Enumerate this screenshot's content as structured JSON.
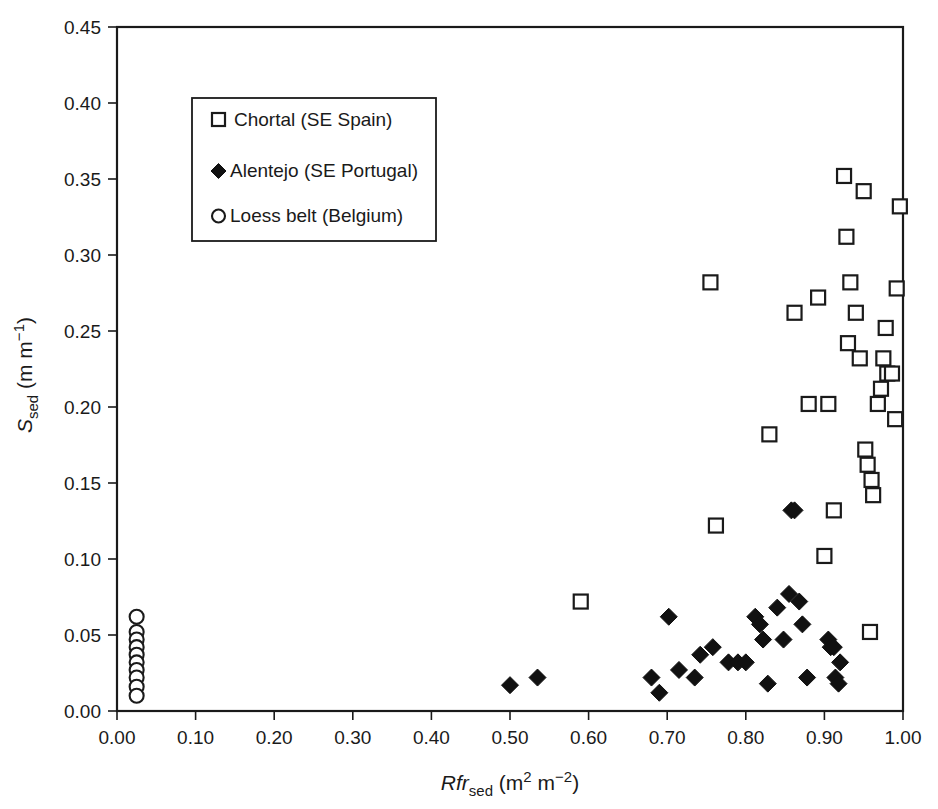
{
  "figure": {
    "width": 938,
    "height": 809,
    "background": "#ffffff",
    "ink_color": "#1a1a1a"
  },
  "chart_data": {
    "type": "scatter",
    "title": "",
    "subtitle": "",
    "xlabel_plain": "Rfr_sed (m2 m-2)",
    "ylabel_plain": "S_sed (m m-1)",
    "xlabel_parts": {
      "italic": "Rfr",
      "subscript": "sed",
      "units_prefix": " (m",
      "units_sup1": "2",
      "units_mid": " m",
      "units_sup2": "−2",
      "units_suffix": ")"
    },
    "ylabel_parts": {
      "italic": "S",
      "subscript": "sed",
      "units_prefix": " (m m",
      "units_sup": "−1",
      "units_suffix": ")"
    },
    "xlim": [
      0.0,
      1.0
    ],
    "ylim": [
      0.0,
      0.45
    ],
    "xticks": [
      0.0,
      0.1,
      0.2,
      0.3,
      0.4,
      0.5,
      0.6,
      0.7,
      0.8,
      0.9,
      1.0
    ],
    "xtick_labels": [
      "0.00",
      "0.10",
      "0.20",
      "0.30",
      "0.40",
      "0.50",
      "0.60",
      "0.70",
      "0.80",
      "0.90",
      "1.00"
    ],
    "yticks": [
      0.0,
      0.05,
      0.1,
      0.15,
      0.2,
      0.25,
      0.3,
      0.35,
      0.4,
      0.45
    ],
    "ytick_labels": [
      "0.00",
      "0.05",
      "0.10",
      "0.15",
      "0.20",
      "0.25",
      "0.30",
      "0.35",
      "0.40",
      "0.45"
    ],
    "grid": false,
    "legend_position": "upper-left-inside",
    "series": [
      {
        "name": "Chortal (SE Spain)",
        "marker": "open-square",
        "marker_color": "#ffffff",
        "edge_color": "#1a1a1a",
        "points": [
          [
            0.59,
            0.072
          ],
          [
            0.755,
            0.282
          ],
          [
            0.762,
            0.122
          ],
          [
            0.83,
            0.182
          ],
          [
            0.862,
            0.262
          ],
          [
            0.88,
            0.202
          ],
          [
            0.892,
            0.272
          ],
          [
            0.9,
            0.102
          ],
          [
            0.905,
            0.202
          ],
          [
            0.912,
            0.132
          ],
          [
            0.925,
            0.352
          ],
          [
            0.928,
            0.312
          ],
          [
            0.93,
            0.242
          ],
          [
            0.933,
            0.282
          ],
          [
            0.94,
            0.262
          ],
          [
            0.945,
            0.232
          ],
          [
            0.95,
            0.342
          ],
          [
            0.952,
            0.172
          ],
          [
            0.955,
            0.162
          ],
          [
            0.958,
            0.052
          ],
          [
            0.96,
            0.152
          ],
          [
            0.962,
            0.142
          ],
          [
            0.968,
            0.202
          ],
          [
            0.972,
            0.212
          ],
          [
            0.975,
            0.232
          ],
          [
            0.978,
            0.252
          ],
          [
            0.98,
            0.222
          ],
          [
            0.986,
            0.222
          ],
          [
            0.99,
            0.192
          ],
          [
            0.992,
            0.278
          ],
          [
            0.996,
            0.332
          ]
        ]
      },
      {
        "name": "Alentejo (SE Portugal)",
        "marker": "filled-diamond",
        "marker_color": "#111111",
        "edge_color": "#111111",
        "points": [
          [
            0.5,
            0.017
          ],
          [
            0.535,
            0.022
          ],
          [
            0.68,
            0.022
          ],
          [
            0.69,
            0.012
          ],
          [
            0.702,
            0.062
          ],
          [
            0.715,
            0.027
          ],
          [
            0.735,
            0.022
          ],
          [
            0.742,
            0.037
          ],
          [
            0.758,
            0.042
          ],
          [
            0.778,
            0.032
          ],
          [
            0.79,
            0.032
          ],
          [
            0.8,
            0.032
          ],
          [
            0.812,
            0.062
          ],
          [
            0.818,
            0.057
          ],
          [
            0.822,
            0.047
          ],
          [
            0.828,
            0.018
          ],
          [
            0.84,
            0.068
          ],
          [
            0.848,
            0.047
          ],
          [
            0.855,
            0.077
          ],
          [
            0.858,
            0.132
          ],
          [
            0.862,
            0.132
          ],
          [
            0.868,
            0.072
          ],
          [
            0.872,
            0.057
          ],
          [
            0.878,
            0.022
          ],
          [
            0.905,
            0.047
          ],
          [
            0.908,
            0.042
          ],
          [
            0.912,
            0.042
          ],
          [
            0.914,
            0.022
          ],
          [
            0.918,
            0.018
          ],
          [
            0.92,
            0.032
          ]
        ]
      },
      {
        "name": "Loess belt (Belgium)",
        "marker": "open-circle",
        "marker_color": "#ffffff",
        "edge_color": "#1a1a1a",
        "points": [
          [
            0.025,
            0.062
          ],
          [
            0.025,
            0.052
          ],
          [
            0.025,
            0.047
          ],
          [
            0.025,
            0.042
          ],
          [
            0.025,
            0.037
          ],
          [
            0.025,
            0.032
          ],
          [
            0.025,
            0.027
          ],
          [
            0.025,
            0.022
          ],
          [
            0.025,
            0.016
          ],
          [
            0.025,
            0.01
          ]
        ]
      }
    ]
  },
  "legend": {
    "entries": [
      {
        "marker": "open-square",
        "label": "Chortal (SE Spain)"
      },
      {
        "marker": "filled-diamond",
        "label": "Alentejo (SE Portugal)"
      },
      {
        "marker": "open-circle",
        "label": "Loess belt (Belgium)"
      }
    ]
  }
}
